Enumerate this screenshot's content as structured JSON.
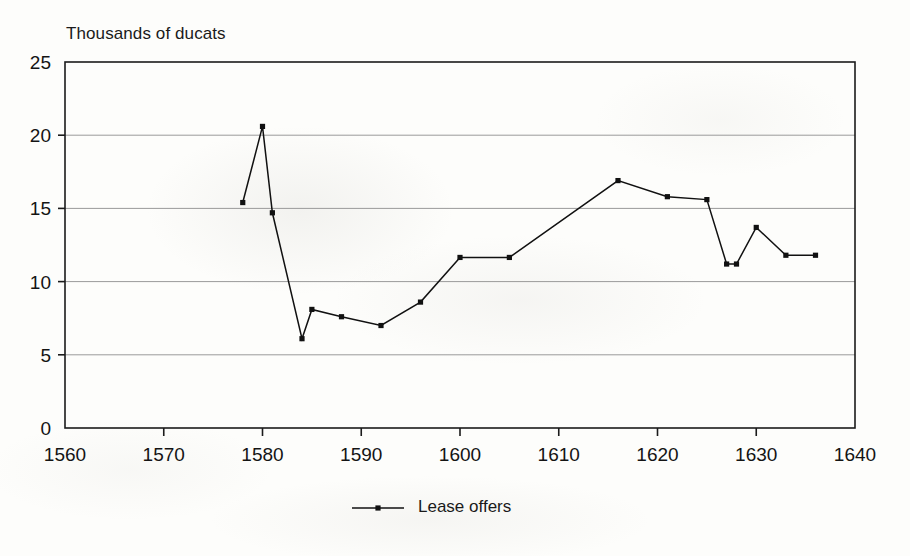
{
  "chart_data": {
    "type": "line",
    "title": "Thousands of ducats",
    "xlabel": "",
    "ylabel": "Thousands of ducats",
    "xlim": [
      1560,
      1640
    ],
    "ylim": [
      0,
      25
    ],
    "xticks": [
      1560,
      1570,
      1580,
      1590,
      1600,
      1610,
      1620,
      1630,
      1640
    ],
    "yticks": [
      0,
      5,
      10,
      15,
      20,
      25
    ],
    "grid": "horizontal",
    "legend_position": "bottom-center",
    "series": [
      {
        "name": "Lease offers",
        "marker": "square",
        "color": "#111111",
        "x": [
          1578,
          1580,
          1581,
          1584,
          1585,
          1588,
          1592,
          1596,
          1600,
          1605,
          1616,
          1621,
          1625,
          1627,
          1628,
          1630,
          1633,
          1636
        ],
        "values": [
          15.4,
          20.6,
          14.7,
          6.1,
          8.1,
          7.6,
          7.0,
          8.6,
          11.65,
          11.65,
          16.9,
          15.8,
          15.6,
          11.2,
          11.2,
          13.7,
          11.8,
          11.8
        ]
      }
    ]
  },
  "legend": {
    "entries": [
      {
        "label": "Lease offers"
      }
    ]
  }
}
